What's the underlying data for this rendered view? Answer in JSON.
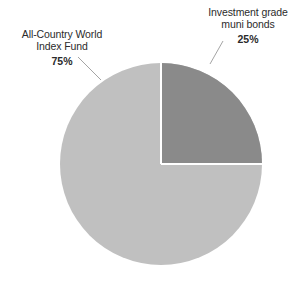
{
  "chart_data": {
    "type": "pie",
    "title": "",
    "xlabel": "",
    "ylabel": "",
    "categories": [
      "All-Country World Index Fund",
      "Investment grade muni bonds"
    ],
    "values": [
      75,
      25
    ],
    "value_labels": [
      "75%",
      "25%"
    ],
    "units": "percent",
    "legend": "none",
    "grid": false,
    "start_angle_deg": 0,
    "direction": "clockwise",
    "slice_colors": [
      "#c0c0c0",
      "#8a8a8a"
    ],
    "separator_color": "#ffffff",
    "series": [
      {
        "name": "Portfolio allocation",
        "values": [
          75,
          25
        ]
      }
    ],
    "annotations": [
      {
        "text": "All-Country World Index Fund",
        "value": "75%",
        "position": "upper-left",
        "leader_line": true
      },
      {
        "text": "Investment grade muni bonds",
        "value": "25%",
        "position": "upper-right",
        "leader_line": true
      }
    ]
  },
  "slices": {
    "world_fund": {
      "line1": "All-Country World",
      "line2": "Index Fund",
      "percent": "75%",
      "color": "#c0c0c0"
    },
    "muni_bonds": {
      "line1": "Investment grade",
      "line2": "muni bonds",
      "percent": "25%",
      "color": "#8a8a8a"
    }
  }
}
